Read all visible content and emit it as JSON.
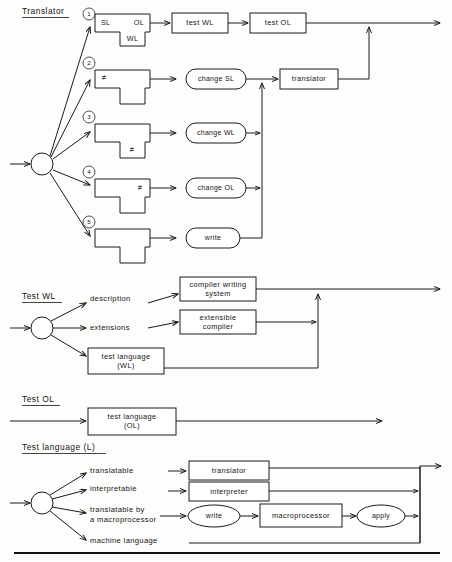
{
  "figure": {
    "accent_color": "#1a1a1a",
    "background_color": "#fdfdfb"
  },
  "sections": {
    "translator": {
      "heading": "Translator",
      "branches": [
        {
          "number": "1",
          "marker": ""
        },
        {
          "number": "2",
          "marker": "≠"
        },
        {
          "number": "3",
          "marker": "≠"
        },
        {
          "number": "4",
          "marker": "≠"
        },
        {
          "number": "5",
          "marker": ""
        }
      ],
      "tbox1": {
        "left_label": "SL",
        "right_label": "OL",
        "stem_label": "WL"
      },
      "process_boxes": [
        {
          "label": "test WL"
        },
        {
          "label": "test OL"
        },
        {
          "label": "translator"
        }
      ],
      "actions": [
        {
          "label": "change SL"
        },
        {
          "label": "change WL"
        },
        {
          "label": "change OL"
        },
        {
          "label": "write"
        }
      ]
    },
    "test_wl": {
      "heading": "Test WL",
      "branch_labels": [
        {
          "label": "description"
        },
        {
          "label": "extensions"
        }
      ],
      "boxes": [
        {
          "line1": "compiler writing",
          "line2": "system"
        },
        {
          "line1": "extensible",
          "line2": "compiler"
        },
        {
          "line1": "test language",
          "line2": "(WL)"
        }
      ]
    },
    "test_ol": {
      "heading": "Test OL",
      "box": {
        "line1": "test language",
        "line2": "(OL)"
      }
    },
    "test_language": {
      "heading": "Test language (L)",
      "branches": [
        {
          "label_line1": "translatable",
          "label_line2": ""
        },
        {
          "label_line1": "interpretable",
          "label_line2": ""
        },
        {
          "label_line1": "translatable by",
          "label_line2": "a macroprocessor"
        },
        {
          "label_line1": "machine language",
          "label_line2": ""
        }
      ],
      "nodes": [
        {
          "label": "translator",
          "shape": "rect"
        },
        {
          "label": "interpreter",
          "shape": "rect"
        },
        {
          "label": "write",
          "shape": "ellipse"
        },
        {
          "label": "macroprocessor",
          "shape": "rect"
        },
        {
          "label": "apply",
          "shape": "ellipse"
        }
      ]
    }
  }
}
